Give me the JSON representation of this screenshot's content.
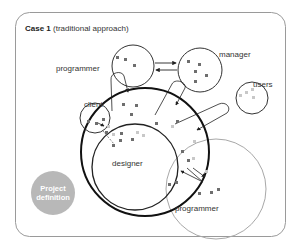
{
  "diagram": {
    "title_bold": "Case 1",
    "title_rest": " (traditional approach)",
    "colors": {
      "frame": "#9a9a9a",
      "circle": "#333333",
      "outer_ring": "#111111",
      "programmer_bottom_ring": "#a0a0a0",
      "dot_dark": "#6e6e6e",
      "dot_light": "#c8c8c8",
      "project_definition_fill": "#b8b8b8"
    },
    "nodes": [
      {
        "id": "programmer-top",
        "label": "programmer"
      },
      {
        "id": "manager",
        "label": "manager"
      },
      {
        "id": "users",
        "label": "users"
      },
      {
        "id": "client",
        "label": "client"
      },
      {
        "id": "designer",
        "label": "designer"
      },
      {
        "id": "programmer-bottom",
        "label": "programmer"
      },
      {
        "id": "project-definition",
        "label_line1": "Project",
        "label_line2": "definition"
      }
    ]
  }
}
